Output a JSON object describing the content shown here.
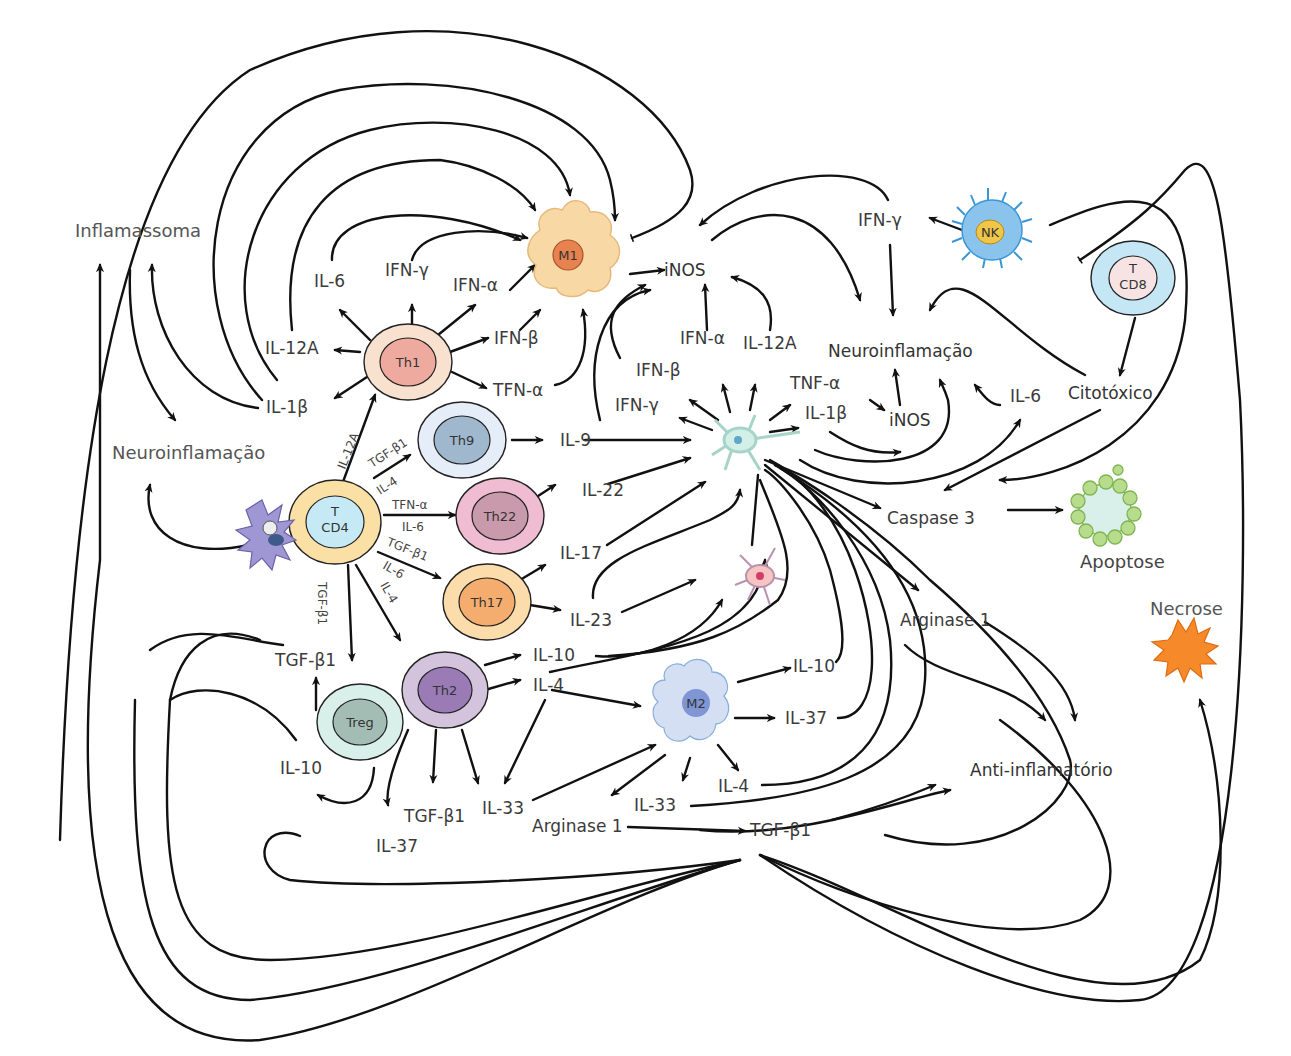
{
  "cells": {
    "m1": "M1",
    "m2": "M2",
    "th1": "Th1",
    "th9": "Th9",
    "th22": "Th22",
    "th17": "Th17",
    "th2": "Th2",
    "treg": "Treg",
    "tcd4_line1": "T",
    "tcd4_line2": "CD4",
    "tcd8_line1": "T",
    "tcd8_line2": "CD8",
    "nk": "NK"
  },
  "labels": {
    "inflamassoma": "Inflamassoma",
    "neuro_left": "Neuroinflamação",
    "neuro_right": "Neuroinflamação",
    "il6_th1": "IL-6",
    "ifng_th1": "IFN-γ",
    "ifna_th1": "IFN-α",
    "ifnb_th1": "IFN-β",
    "tfna_th1": "TFN-α",
    "il12a_th1": "IL-12A",
    "il1b_left": "IL-1β",
    "inos_top": "iNOS",
    "ifna_neuron": "IFN-α",
    "il12a_neuron": "IL-12A",
    "ifnb_neuron": "IFN-β",
    "ifng_neuron": "IFN-γ",
    "tnfa_neuron": "TNF-α",
    "il1b_neuron": "IL-1β",
    "inos_right": "iNOS",
    "il6_right": "IL-6",
    "ifng_nk": "IFN-γ",
    "citotoxico": "Citotóxico",
    "caspase3": "Caspase 3",
    "apoptose": "Apoptose",
    "necrose": "Necrose",
    "il9": "IL-9",
    "il22": "IL-22",
    "il17": "IL-17",
    "il23": "IL-23",
    "il10_th2": "IL-10",
    "il4_th2": "IL-4",
    "arginase1_right": "Arginase 1",
    "il10_m2": "IL-10",
    "il37_m2": "IL-37",
    "il4_m2": "IL-4",
    "anti_inflamatorio": "Anti-inflamatório",
    "tgfb1_treg": "TGF-β1",
    "il10_treg": "IL-10",
    "tgfb1_th2": "TGF-β1",
    "il33_th2": "IL-33",
    "il37_bottom": "IL-37",
    "arginase1_bottom": "Arginase 1",
    "il33_m2": "IL-33",
    "tgfb1_bottom": "TGF-β1"
  },
  "edge_labels": {
    "cd4_th1": "IL-12A",
    "cd4_th9_a": "TGF-β1",
    "cd4_th9_b": "IL-4",
    "cd4_th22_a": "TFN-α",
    "cd4_th22_b": "IL-6",
    "cd4_th17_a": "TGF-β1",
    "cd4_th17_b": "IL-6",
    "cd4_treg": "TGF-β1",
    "cd4_th2": "IL-4"
  },
  "colors": {
    "m1_body": "#f8d9a6",
    "m1_nucleus": "#e8834f",
    "m2_body": "#d5dff4",
    "m2_nucleus": "#7f95d4",
    "th1_outer": "#f8e2cf",
    "th1_inner": "#efaaa0",
    "th9_outer": "#e5eef8",
    "th9_inner": "#9fb8cd",
    "th22_outer": "#efbcd2",
    "th22_inner": "#c999ac",
    "th17_outer": "#fbdcaa",
    "th17_inner": "#f4ad6e",
    "th2_outer": "#d4c3dc",
    "th2_inner": "#9a7bb6",
    "treg_outer": "#d9f0ea",
    "treg_inner": "#a4bdb4",
    "tcd4_outer": "#fbe0a6",
    "tcd4_inner": "#c5eaf6",
    "tcd8_outer": "#c5e6f4",
    "tcd8_inner": "#f7e3e3",
    "nk_body": "#8ac4ec",
    "nk_nucleus": "#f0c64a",
    "neuron": "#d3efe8",
    "astro": "#f7c4c2",
    "apoptose": "#b6dc8c",
    "necrose": "#f68a2a",
    "dendritic": "#9f97d3"
  }
}
